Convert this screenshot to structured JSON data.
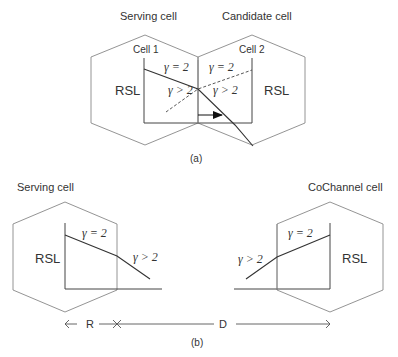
{
  "figure_a": {
    "serving_label": "Serving cell",
    "candidate_label": "Candidate cell",
    "cell1_label": "Cell 1",
    "cell2_label": "Cell 2",
    "rsl_left": "RSL",
    "rsl_right": "RSL",
    "gamma_eq_left": "γ = 2",
    "gamma_gt_left": "γ > 2",
    "gamma_eq_right": "γ = 2",
    "gamma_gt_right": "γ > 2",
    "caption": "(a)"
  },
  "figure_b": {
    "serving_label": "Serving cell",
    "cochannel_label": "CoChannel cell",
    "rsl_left": "RSL",
    "rsl_right": "RSL",
    "gamma_eq_left": "γ = 2",
    "gamma_gt_left": "γ > 2",
    "gamma_eq_right": "γ = 2",
    "gamma_gt_right": "γ > 2",
    "r_label": "R",
    "d_label": "D",
    "caption": "(b)"
  }
}
